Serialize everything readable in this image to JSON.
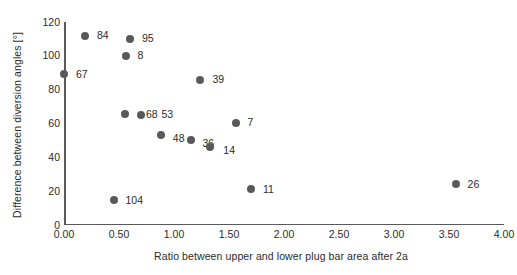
{
  "chart_data": {
    "type": "scatter",
    "title": "",
    "xlabel": "Ratio between upper and lower plug bar area after 2a",
    "ylabel": "Difference between diversion angles [°]",
    "xlim": [
      0.0,
      4.0
    ],
    "ylim": [
      0,
      120
    ],
    "xticks": [
      "0.00",
      "0.50",
      "1.00",
      "1.50",
      "2.00",
      "2.50",
      "3.00",
      "3.50",
      "4.00"
    ],
    "xtick_values": [
      0.0,
      0.5,
      1.0,
      1.5,
      2.0,
      2.5,
      3.0,
      3.5,
      4.0
    ],
    "yticks": [
      "0",
      "20",
      "40",
      "60",
      "80",
      "100",
      "120"
    ],
    "ytick_values": [
      0,
      20,
      40,
      60,
      80,
      100,
      120
    ],
    "grid": false,
    "legend": "none",
    "marker_color": "#59595c",
    "axis_color": "#59595c",
    "points": [
      {
        "label": "84",
        "x": 0.19,
        "y": 112.0,
        "label_dx": 12,
        "label_dy": 0
      },
      {
        "label": "95",
        "x": 0.6,
        "y": 110.0,
        "label_dx": 12,
        "label_dy": 0
      },
      {
        "label": "8",
        "x": 0.56,
        "y": 100.0,
        "label_dx": 12,
        "label_dy": 0
      },
      {
        "label": "67",
        "x": 0.0,
        "y": 89.0,
        "label_dx": 12,
        "label_dy": 0
      },
      {
        "label": "39",
        "x": 1.24,
        "y": 86.0,
        "label_dx": 12,
        "label_dy": 0
      },
      {
        "label": "68",
        "x": 0.7,
        "y": 65.0,
        "label_dx": 5,
        "label_dy": -1
      },
      {
        "label": "53",
        "x": 0.55,
        "y": 65.5,
        "label_dx": 37,
        "label_dy": 0
      },
      {
        "label": "7",
        "x": 1.56,
        "y": 60.5,
        "label_dx": 12,
        "label_dy": 0
      },
      {
        "label": "48",
        "x": 0.88,
        "y": 53.0,
        "label_dx": 12,
        "label_dy": 3
      },
      {
        "label": "36",
        "x": 1.15,
        "y": 50.0,
        "label_dx": 12,
        "label_dy": 3
      },
      {
        "label": "14",
        "x": 1.33,
        "y": 46.0,
        "label_dx": 13,
        "label_dy": 3
      },
      {
        "label": "26",
        "x": 3.56,
        "y": 24.0,
        "label_dx": 12,
        "label_dy": 0
      },
      {
        "label": "11",
        "x": 1.7,
        "y": 21.0,
        "label_dx": 12,
        "label_dy": 0
      },
      {
        "label": "104",
        "x": 0.45,
        "y": 14.5,
        "label_dx": 12,
        "label_dy": 0
      }
    ]
  }
}
